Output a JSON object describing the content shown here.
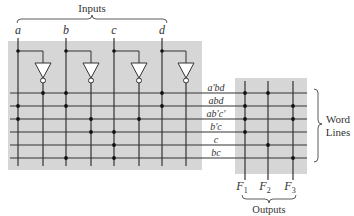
{
  "title": "Inputs",
  "inputs": [
    {
      "name": "a",
      "x": 18,
      "inv_x": 43
    },
    {
      "name": "b",
      "x": 66,
      "inv_x": 91
    },
    {
      "name": "c",
      "x": 114,
      "inv_x": 139
    },
    {
      "name": "d",
      "x": 162,
      "inv_x": 186
    }
  ],
  "word_lines": {
    "label_line1": "Word",
    "label_line2": "Lines",
    "rows": [
      {
        "term": "a′bd",
        "y": 93,
        "and_taps": [
          43,
          66,
          162
        ],
        "or_taps": [
          245,
          268
        ]
      },
      {
        "term": "abd",
        "y": 106,
        "and_taps": [
          18,
          66,
          162
        ],
        "or_taps": [
          245,
          293
        ]
      },
      {
        "term": "ab′c′",
        "y": 119,
        "and_taps": [
          18,
          91,
          139
        ],
        "or_taps": [
          245,
          293
        ]
      },
      {
        "term": "b′c",
        "y": 132,
        "and_taps": [
          91,
          114
        ],
        "or_taps": [
          245
        ]
      },
      {
        "term": "c",
        "y": 145,
        "and_taps": [
          114
        ],
        "or_taps": [
          268
        ]
      },
      {
        "term": "bc",
        "y": 158,
        "and_taps": [
          66,
          114
        ],
        "or_taps": [
          293
        ]
      }
    ]
  },
  "outputs": {
    "label": "Outputs",
    "items": [
      {
        "name": "F",
        "sub": "1",
        "x": 245
      },
      {
        "name": "F",
        "sub": "2",
        "x": 268
      },
      {
        "name": "F",
        "sub": "3",
        "x": 293
      }
    ]
  },
  "colors": {
    "array_bg": "#d6d6d6",
    "line": "#333333",
    "dot": "#111111",
    "text": "#333333"
  }
}
